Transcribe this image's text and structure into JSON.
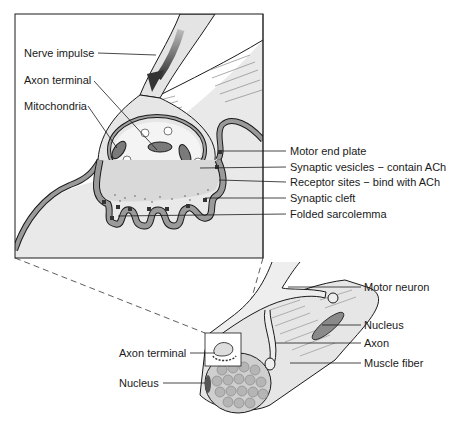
{
  "diagram": {
    "type": "neuromuscular-junction",
    "inset_labels_left": [
      {
        "id": "nerve-impulse",
        "text": "Nerve impulse"
      },
      {
        "id": "axon-terminal",
        "text": "Axon terminal"
      },
      {
        "id": "mitochondria",
        "text": "Mitochondria"
      }
    ],
    "inset_labels_right": [
      {
        "id": "motor-end-plate",
        "text": "Motor end plate"
      },
      {
        "id": "synaptic-vesicles",
        "text": "Synaptic vesicles − contain ACh"
      },
      {
        "id": "receptor-sites",
        "text": "Receptor sites − bind with ACh"
      },
      {
        "id": "synaptic-cleft",
        "text": "Synaptic cleft"
      },
      {
        "id": "folded-sarcolemma",
        "text": "Folded sarcolemma"
      }
    ],
    "fiber_labels_right": [
      {
        "id": "motor-neuron",
        "text": "Motor neuron"
      },
      {
        "id": "nucleus-right",
        "text": "Nucleus"
      },
      {
        "id": "axon",
        "text": "Axon"
      },
      {
        "id": "muscle-fiber",
        "text": "Muscle fiber"
      }
    ],
    "fiber_labels_left": [
      {
        "id": "axon-terminal-small",
        "text": "Axon terminal"
      },
      {
        "id": "nucleus-left",
        "text": "Nucleus"
      }
    ],
    "colors": {
      "line": "#1a1a1a",
      "fill_light": "#e4e4e4",
      "fill_mid": "#9a9a9a",
      "fill_dark": "#555555",
      "background": "#ffffff"
    }
  }
}
